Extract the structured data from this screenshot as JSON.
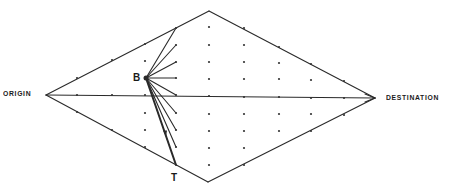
{
  "labels": {
    "origin": "ORIGIN",
    "destination": "DESTINATION",
    "node_b": "B",
    "node_t": "T"
  },
  "colors": {
    "line": "#2a2a2a",
    "dot": "#333333",
    "background": "#ffffff"
  },
  "geometry": {
    "origin": [
      46,
      95
    ],
    "destination": [
      375,
      98
    ],
    "top": [
      209,
      11
    ],
    "bottom": [
      208,
      182
    ],
    "b": [
      146,
      78
    ],
    "t": [
      176,
      165
    ]
  },
  "grid_points": [
    [
      77,
      78
    ],
    [
      112,
      60
    ],
    [
      145,
      44
    ],
    [
      176,
      28
    ],
    [
      77,
      112
    ],
    [
      112,
      130
    ],
    [
      145,
      147
    ],
    [
      77,
      95
    ],
    [
      112,
      95
    ],
    [
      145,
      95
    ],
    [
      145,
      61
    ],
    [
      145,
      113
    ],
    [
      145,
      130
    ],
    [
      176,
      45
    ],
    [
      176,
      62
    ],
    [
      176,
      78
    ],
    [
      176,
      95
    ],
    [
      176,
      113
    ],
    [
      176,
      130
    ],
    [
      176,
      147
    ],
    [
      209,
      27
    ],
    [
      209,
      45
    ],
    [
      209,
      62
    ],
    [
      209,
      79
    ],
    [
      209,
      96
    ],
    [
      209,
      114
    ],
    [
      209,
      131
    ],
    [
      209,
      148
    ],
    [
      209,
      165
    ],
    [
      244,
      28
    ],
    [
      244,
      45
    ],
    [
      244,
      62
    ],
    [
      244,
      79
    ],
    [
      244,
      97
    ],
    [
      244,
      114
    ],
    [
      244,
      131
    ],
    [
      244,
      148
    ],
    [
      244,
      165
    ],
    [
      279,
      47
    ],
    [
      279,
      63
    ],
    [
      279,
      79
    ],
    [
      279,
      97
    ],
    [
      279,
      114
    ],
    [
      279,
      131
    ],
    [
      311,
      64
    ],
    [
      311,
      80
    ],
    [
      311,
      98
    ],
    [
      311,
      114
    ],
    [
      311,
      131
    ],
    [
      344,
      81
    ],
    [
      344,
      98
    ],
    [
      344,
      115
    ]
  ],
  "b_rays_to": [
    [
      176,
      28
    ],
    [
      176,
      45
    ],
    [
      176,
      62
    ],
    [
      176,
      78
    ],
    [
      176,
      95
    ],
    [
      176,
      113
    ],
    [
      176,
      130
    ],
    [
      176,
      147
    ]
  ]
}
